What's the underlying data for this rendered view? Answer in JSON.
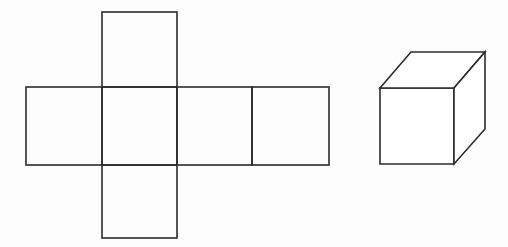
{
  "diagram": {
    "stroke_color": "#2b2b2b",
    "background_color": "#ffffff",
    "net": {
      "label": "cube-net-cross",
      "squares": [
        {
          "name": "top-square",
          "x": 102,
          "y": 12,
          "w": 75,
          "h": 75
        },
        {
          "name": "left-square",
          "x": 26,
          "y": 87,
          "w": 76,
          "h": 78
        },
        {
          "name": "center-square",
          "x": 102,
          "y": 87,
          "w": 75,
          "h": 78
        },
        {
          "name": "right-square",
          "x": 177,
          "y": 87,
          "w": 75,
          "h": 78
        },
        {
          "name": "far-right-square",
          "x": 252,
          "y": 87,
          "w": 77,
          "h": 78
        },
        {
          "name": "bottom-square",
          "x": 102,
          "y": 165,
          "w": 75,
          "h": 73
        }
      ]
    },
    "cube": {
      "label": "assembled-cube",
      "front_face": "380,88 454,88 454,164 380,164",
      "top_face": "380,88 411,52 485,52 454,88",
      "right_face": "454,88 485,52 485,129 454,164"
    }
  }
}
